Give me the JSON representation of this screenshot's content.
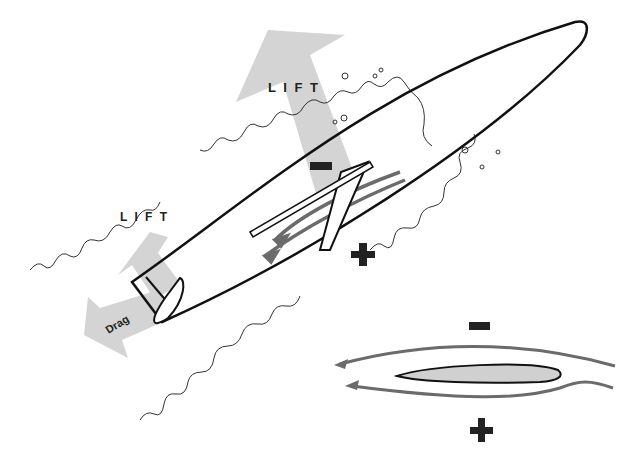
{
  "diagram": {
    "title": "",
    "labels": {
      "lift_large": "L I F T",
      "lift_small": "L I F T",
      "drag": "Drag",
      "minus_fin": "−",
      "plus_fin": "+",
      "minus_foil": "−",
      "plus_foil": "+"
    },
    "colors": {
      "arrow_fill": "#d4d4d4",
      "outline": "#111111",
      "flow_lines": "#6b6b6b",
      "foil_fill": "#d0d0d0",
      "wake": "#333333",
      "background": "#ffffff"
    },
    "components": [
      "board-hull",
      "fin",
      "large-lift-arrow",
      "small-lift-arrow",
      "drag-arrow",
      "water-wake",
      "flow-lines",
      "airfoil-cross-section"
    ]
  }
}
